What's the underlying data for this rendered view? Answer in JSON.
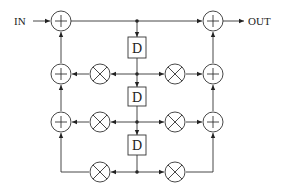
{
  "diagram": {
    "type": "block-diagram",
    "input_label": "IN",
    "output_label": "OUT",
    "delay_label": "D",
    "colors": {
      "stroke": "#333333",
      "background": "#ffffff"
    },
    "adders_left": [
      {
        "id": "adder-l1",
        "symbol": "+"
      },
      {
        "id": "adder-l2",
        "symbol": "+"
      },
      {
        "id": "adder-l3",
        "symbol": "+"
      }
    ],
    "adders_right": [
      {
        "id": "adder-r1",
        "symbol": "+"
      },
      {
        "id": "adder-r2",
        "symbol": "+"
      },
      {
        "id": "adder-r3",
        "symbol": "+"
      }
    ],
    "multipliers_left": [
      {
        "id": "mult-l1",
        "symbol": "×"
      },
      {
        "id": "mult-l2",
        "symbol": "×"
      },
      {
        "id": "mult-l3",
        "symbol": "×"
      }
    ],
    "multipliers_right": [
      {
        "id": "mult-r1",
        "symbol": "×"
      },
      {
        "id": "mult-r2",
        "symbol": "×"
      },
      {
        "id": "mult-r3",
        "symbol": "×"
      }
    ],
    "delays": [
      {
        "id": "delay-1",
        "label": "D"
      },
      {
        "id": "delay-2",
        "label": "D"
      },
      {
        "id": "delay-3",
        "label": "D"
      }
    ]
  }
}
